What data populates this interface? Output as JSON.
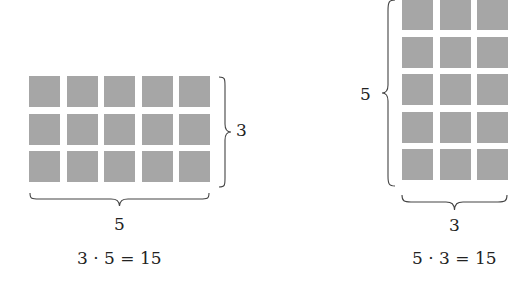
{
  "colors": {
    "square_fill": "#a6a6a6",
    "brace_stroke": "#444444",
    "text": "#222222"
  },
  "left_figure": {
    "rows": 3,
    "cols": 5,
    "row_label": "3",
    "col_label": "5",
    "equation": "3 · 5 = 15"
  },
  "right_figure": {
    "rows": 5,
    "cols": 3,
    "row_label": "5",
    "col_label": "3",
    "equation": "5 · 3 = 15"
  }
}
